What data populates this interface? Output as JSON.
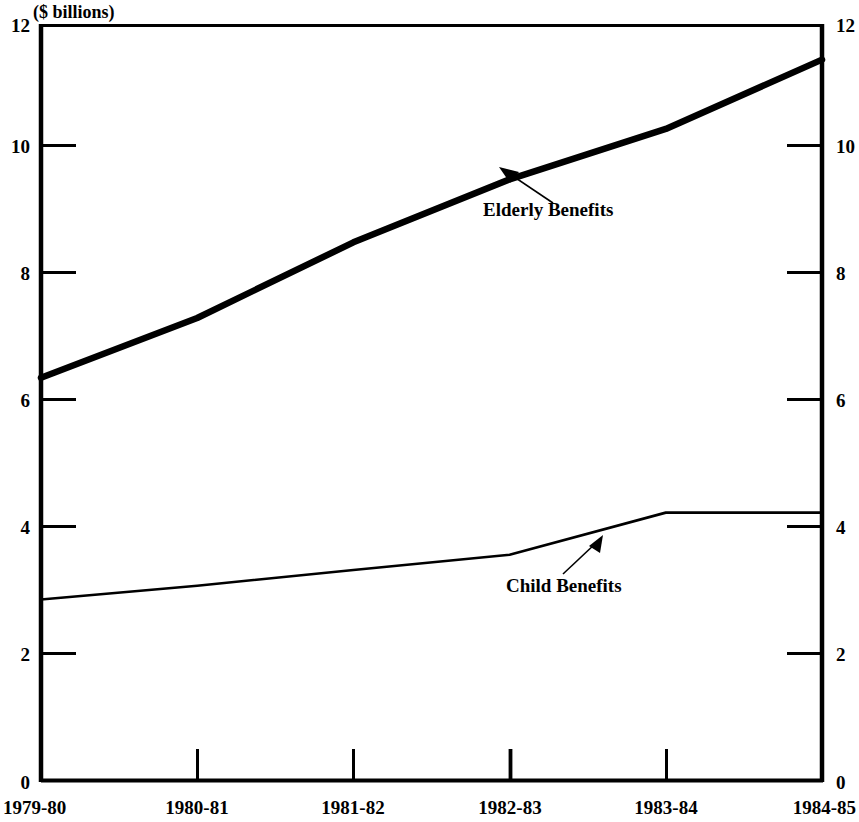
{
  "chart_data": {
    "type": "line",
    "title": "($ billions)",
    "xlabel": "",
    "ylabel": "",
    "ylim": [
      0,
      12
    ],
    "yticks": [
      0,
      2,
      4,
      6,
      8,
      10,
      12
    ],
    "ytick_labels_left": [
      "0",
      "2",
      "4",
      "6",
      "8",
      "10",
      "12"
    ],
    "ytick_labels_right": [
      "0",
      "2",
      "4",
      "6",
      "8",
      "10",
      "12"
    ],
    "grid": false,
    "legend_position": "inline-annotations",
    "categories": [
      "1979-80",
      "1980-81",
      "1981-82",
      "1982-83",
      "1983-84",
      "1984-85"
    ],
    "series": [
      {
        "name": "Elderly Benefits",
        "values": [
          6.4,
          7.35,
          8.55,
          9.55,
          10.35,
          11.45
        ],
        "line_weight": "thick"
      },
      {
        "name": "Child Benefits",
        "values": [
          2.88,
          3.1,
          3.35,
          3.59,
          4.26,
          4.26
        ],
        "line_weight": "thin"
      }
    ],
    "annotations": [
      {
        "label": "Elderly Benefits",
        "points_to_series": "Elderly Benefits",
        "arrow_direction": "up-left"
      },
      {
        "label": "Child Benefits",
        "points_to_series": "Child Benefits",
        "arrow_direction": "up-right"
      }
    ],
    "colors": {
      "line": "#000000",
      "axis": "#000000",
      "background": "#ffffff"
    }
  }
}
